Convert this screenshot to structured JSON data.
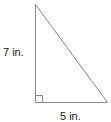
{
  "diagram": {
    "type": "right-triangle",
    "stroke_color": "#8a8a8a",
    "labels": {
      "height": "7 in.",
      "base": "5 in."
    },
    "right_angle_marker": true
  }
}
